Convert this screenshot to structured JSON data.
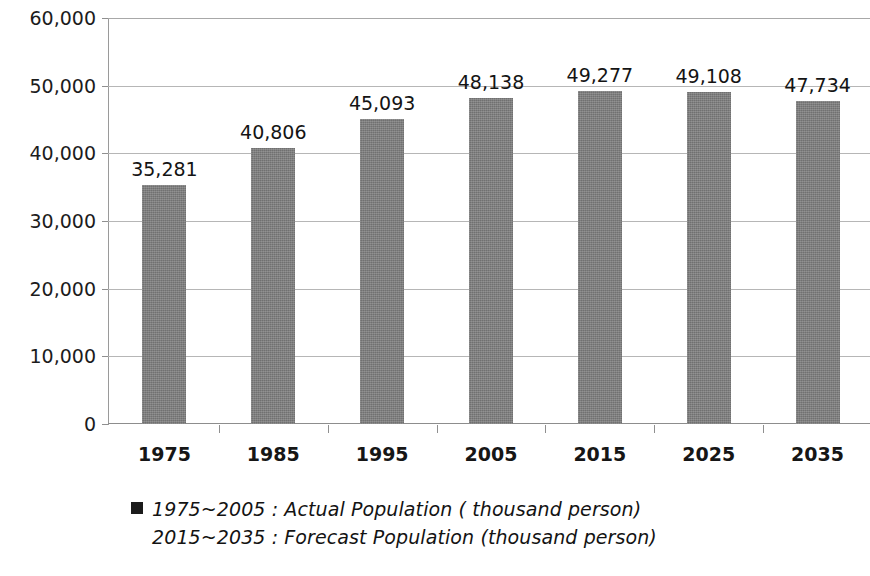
{
  "chart_data": {
    "type": "bar",
    "title": "",
    "subtitle": "",
    "xlabel": "",
    "ylabel": "",
    "categories": [
      "1975",
      "1985",
      "1995",
      "2005",
      "2015",
      "2025",
      "2035"
    ],
    "values": [
      35281,
      40806,
      45093,
      48138,
      49277,
      49108,
      47734
    ],
    "value_labels": [
      "35,281",
      "40,806",
      "45,093",
      "48,138",
      "49,277",
      "49,108",
      "47,734"
    ],
    "series": [
      {
        "name": "Population (thousand person)",
        "values": [
          35281,
          40806,
          45093,
          48138,
          49277,
          49108,
          47734
        ]
      }
    ],
    "ylim": [
      0,
      60000
    ],
    "ytick_values": [
      0,
      10000,
      20000,
      30000,
      40000,
      50000,
      60000
    ],
    "ytick_labels": [
      "0",
      "10,000",
      "20,000",
      "30,000",
      "40,000",
      "50,000",
      "60,000"
    ],
    "grid": true,
    "grid_axis": "y",
    "legend_position": "bottom",
    "bar_color": "#7b7b7b",
    "grid_color": "#b6b6b6",
    "axis_color": "#9a9a9a",
    "background_color": "#ffffff",
    "annotations": [
      "1975~2005 : Actual  Population ( thousand person)",
      "2015~2035 :  Forecast Population (thousand  person)"
    ]
  },
  "legend": {
    "marker_color": "#1b1b1b",
    "entries": [
      {
        "marker": true,
        "label": "1975~2005 : Actual  Population ( thousand person)"
      },
      {
        "marker": false,
        "label": "2015~2035 :  Forecast Population (thousand  person)"
      }
    ]
  }
}
